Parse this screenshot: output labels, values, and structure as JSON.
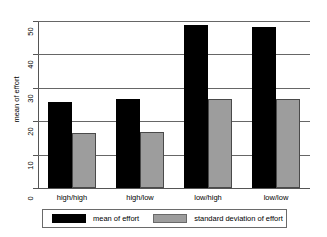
{
  "chart_data": {
    "type": "bar",
    "title": "",
    "xlabel": "",
    "ylabel": "mean of effort",
    "categories": [
      "high/high",
      "high/low",
      "low/high",
      "low/low"
    ],
    "series": [
      {
        "name": "mean of effort",
        "color": "#000000",
        "values": [
          25.7,
          26.8,
          48.8,
          48.2
        ]
      },
      {
        "name": "standard deviation of effort",
        "color": "#9d9d9d",
        "values": [
          16.6,
          16.9,
          26.6,
          26.6
        ]
      }
    ],
    "ylim": [
      0,
      50
    ],
    "yticks": [
      0,
      10,
      20,
      30,
      40,
      50
    ],
    "ytick_labels": [
      "0",
      "10",
      "20",
      "30",
      "40",
      "50"
    ],
    "grid": "horizontal",
    "legend_position": "bottom"
  },
  "axis": {
    "y_title": "mean of effort"
  },
  "legend": {
    "entries": [
      {
        "label": "mean of effort",
        "swatch": "black-swatch"
      },
      {
        "label": "standard deviation of effort",
        "swatch": "gray-swatch"
      }
    ]
  }
}
